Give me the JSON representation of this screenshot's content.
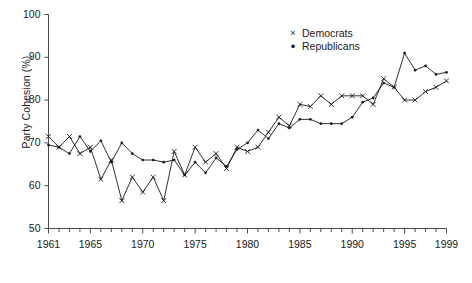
{
  "chart_data": {
    "type": "line",
    "title": "",
    "xlabel": "",
    "ylabel": "Party Cohesion (%)",
    "xlim": [
      1961,
      1999
    ],
    "ylim": [
      50,
      100
    ],
    "yticks": [
      50,
      60,
      70,
      80,
      90,
      100
    ],
    "xticks": [
      1961,
      1965,
      1970,
      1975,
      1980,
      1985,
      1990,
      1995,
      1999
    ],
    "xtick_labels": [
      "1961",
      "1965",
      "1970",
      "1975",
      "1980",
      "1985",
      "1990",
      "1995",
      "1999"
    ],
    "ytick_labels": [
      "50",
      "60",
      "70",
      "80",
      "90",
      "100"
    ],
    "minor_xticks_every": 1,
    "grid": false,
    "legend_position": "top-right",
    "x": [
      1961,
      1962,
      1963,
      1964,
      1965,
      1966,
      1967,
      1968,
      1969,
      1970,
      1971,
      1972,
      1973,
      1974,
      1975,
      1976,
      1977,
      1978,
      1979,
      1980,
      1981,
      1982,
      1983,
      1984,
      1985,
      1986,
      1987,
      1988,
      1989,
      1990,
      1991,
      1992,
      1993,
      1994,
      1995,
      1996,
      1997,
      1998,
      1999
    ],
    "series": [
      {
        "name": "Democrats",
        "marker": "x",
        "color": "#1a1a1a",
        "values": [
          71.5,
          69.0,
          71.5,
          67.5,
          69.0,
          61.5,
          66.0,
          56.5,
          62.0,
          58.5,
          62.0,
          56.5,
          68.0,
          62.5,
          69.0,
          65.5,
          67.5,
          64.0,
          69.0,
          68.0,
          69.0,
          72.5,
          76.0,
          74.0,
          79.0,
          78.5,
          81.0,
          79.0,
          81.0,
          81.0,
          81.0,
          79.0,
          85.0,
          83.0,
          80.0,
          80.0,
          82.0,
          83.0,
          84.5
        ]
      },
      {
        "name": "Republicans",
        "marker": "dot",
        "color": "#1a1a1a",
        "values": [
          69.5,
          69.0,
          67.5,
          71.5,
          68.0,
          70.5,
          65.5,
          70.0,
          67.5,
          66.0,
          66.0,
          65.5,
          66.0,
          62.5,
          65.5,
          63.0,
          66.5,
          64.5,
          68.5,
          70.0,
          73.0,
          71.0,
          74.5,
          73.5,
          75.5,
          75.5,
          74.5,
          74.5,
          74.5,
          76.0,
          79.5,
          80.5,
          84.0,
          83.0,
          91.0,
          87.0,
          88.0,
          86.0,
          86.5
        ]
      }
    ]
  },
  "legend": {
    "items": [
      {
        "marker": "×",
        "label": "Democrats"
      },
      {
        "marker": "•",
        "label": "Republicans"
      }
    ]
  },
  "caption": {
    "text": ""
  }
}
